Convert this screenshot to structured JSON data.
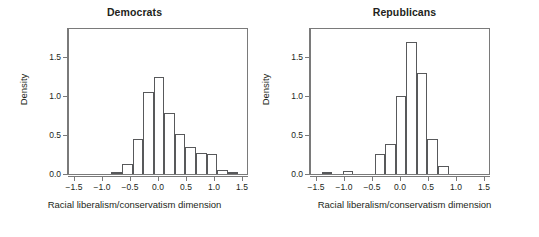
{
  "figure": {
    "background": "#ffffff",
    "frame_color": "#7a7a7a",
    "bar_outline_color": "#58595b",
    "text_color": "#231f20"
  },
  "chart_data": [
    {
      "type": "bar",
      "title": "Democrats",
      "xlabel": "Racial liberalism/conservatism dimension",
      "ylabel": "Density",
      "xlim": [
        -1.7,
        1.7
      ],
      "ylim": [
        0.0,
        1.78
      ],
      "xticks": [
        -1.5,
        -1.0,
        -0.5,
        0.0,
        0.5,
        1.0,
        1.5
      ],
      "xtick_labels": [
        "−1.5",
        "−1.0",
        "−0.5",
        "0.0",
        "0.5",
        "1.0",
        "1.5"
      ],
      "yticks": [
        0.0,
        0.5,
        1.0,
        1.5
      ],
      "ytick_labels": [
        "0.0",
        "0.5",
        "1.0",
        "1.5"
      ],
      "grid": false,
      "legend": "none",
      "bin_width": 0.2,
      "bin_edges": [
        -0.9,
        -0.7,
        -0.5,
        -0.3,
        -0.1,
        0.1,
        0.3,
        0.5,
        0.7,
        0.9,
        1.1,
        1.3,
        1.5
      ],
      "bin_centers": [
        -0.8,
        -0.6,
        -0.4,
        -0.2,
        0.0,
        0.2,
        0.4,
        0.6,
        0.8,
        1.0,
        1.2,
        1.4
      ],
      "values": [
        0.02,
        0.12,
        0.43,
        0.99,
        1.18,
        0.74,
        0.48,
        0.33,
        0.26,
        0.24,
        0.05,
        0.02
      ]
    },
    {
      "type": "bar",
      "title": "Republicans",
      "xlabel": "Racial liberalism/conservatism dimension",
      "ylabel": "Density",
      "xlim": [
        -1.7,
        1.7
      ],
      "ylim": [
        0.0,
        1.78
      ],
      "xticks": [
        -1.5,
        -1.0,
        -0.5,
        0.0,
        0.5,
        1.0,
        1.5
      ],
      "xtick_labels": [
        "−1.5",
        "−1.0",
        "−0.5",
        "0.0",
        "0.5",
        "1.0",
        "1.5"
      ],
      "yticks": [
        0.0,
        0.5,
        1.0,
        1.5
      ],
      "ytick_labels": [
        "0.0",
        "0.5",
        "1.0",
        "1.5"
      ],
      "grid": false,
      "legend": "none",
      "bin_width": 0.2,
      "bin_edges": [
        -1.5,
        -1.3,
        -1.1,
        -0.9,
        -0.7,
        -0.5,
        -0.3,
        -0.1,
        0.1,
        0.3,
        0.5,
        0.7
      ],
      "bin_centers": [
        -1.4,
        -1.2,
        -1.0,
        -0.8,
        -0.6,
        -0.4,
        -0.2,
        0.0,
        0.2,
        0.4,
        0.6
      ],
      "values": [
        0.02,
        0.0,
        0.04,
        0.0,
        0.0,
        0.24,
        0.36,
        0.94,
        1.6,
        1.22,
        0.42,
        0.1
      ]
    }
  ]
}
